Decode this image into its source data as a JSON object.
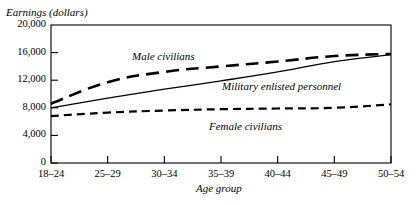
{
  "chart_data": {
    "type": "line",
    "title": "",
    "ylabel": "Earnings (dollars)",
    "xlabel": "Age group",
    "categories": [
      "18–24",
      "25–29",
      "30–34",
      "35–39",
      "40–44",
      "45–49",
      "50–54"
    ],
    "ylim": [
      0,
      20000
    ],
    "yticks": [
      0,
      4000,
      8000,
      12000,
      16000,
      20000
    ],
    "ytick_labels": [
      "0",
      "4,000",
      "8,000",
      "12,000",
      "16,000",
      "20,000"
    ],
    "grid": false,
    "legend": "inline-annotations",
    "series": [
      {
        "name": "Male civilians",
        "style": "dashed",
        "values": [
          8600,
          11700,
          13200,
          14000,
          14700,
          15500,
          15800
        ]
      },
      {
        "name": "Military enlisted personnel",
        "style": "solid",
        "values": [
          8000,
          9400,
          10700,
          11900,
          13200,
          14700,
          15700
        ]
      },
      {
        "name": "Female civilians",
        "style": "dashed",
        "values": [
          6800,
          7300,
          7600,
          7800,
          7900,
          8000,
          8500
        ]
      }
    ],
    "annotations": [
      {
        "text": "Male civilians",
        "x": 132,
        "y": 50
      },
      {
        "text": "Military enlisted personnel",
        "x": 222,
        "y": 80
      },
      {
        "text": "Female civilians",
        "x": 209,
        "y": 120
      }
    ]
  }
}
